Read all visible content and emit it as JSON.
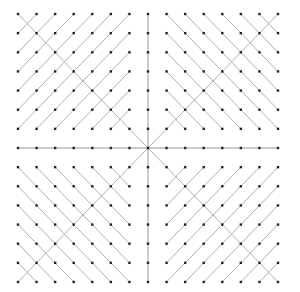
{
  "diagram": {
    "type": "dot-grid-line-pattern",
    "grid_size": 15,
    "center_index": 7,
    "origin": {
      "x": 18,
      "y": 14
    },
    "extent": {
      "x": 278,
      "y": 282
    },
    "colors": {
      "background": "#ffffff",
      "dot": "#222222",
      "line": "#b0b0b0",
      "axis_line": "#9a9a9a"
    },
    "quadrants": [
      {
        "name": "top-left",
        "main_diagonal": "backslash",
        "hatch": "slash"
      },
      {
        "name": "top-right",
        "main_diagonal": "slash",
        "hatch": "backslash"
      },
      {
        "name": "bottom-left",
        "main_diagonal": "slash",
        "hatch": "backslash"
      },
      {
        "name": "bottom-right",
        "main_diagonal": "backslash",
        "hatch": "slash"
      }
    ],
    "axes": [
      "vertical-center",
      "horizontal-center"
    ]
  }
}
